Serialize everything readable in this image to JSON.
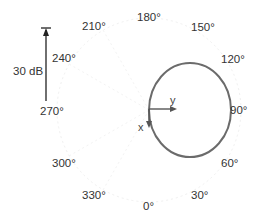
{
  "diagram": {
    "type": "polar-radiation-pattern",
    "colors": {
      "pattern": "#6b6b6b",
      "arrows": "#555555",
      "scale_bar": "#222222",
      "grid": "#eeeeee",
      "text": "#333333"
    },
    "angle_labels": [
      {
        "text": "180°",
        "angle": 180
      },
      {
        "text": "150°",
        "angle": 150
      },
      {
        "text": "120°",
        "angle": 120
      },
      {
        "text": "90°",
        "angle": 90
      },
      {
        "text": "60°",
        "angle": 60
      },
      {
        "text": "30°",
        "angle": 30
      },
      {
        "text": "0°",
        "angle": 0
      },
      {
        "text": "330°",
        "angle": 330
      },
      {
        "text": "300°",
        "angle": 300
      },
      {
        "text": "270°",
        "angle": 270
      },
      {
        "text": "240°",
        "angle": 240
      },
      {
        "text": "210°",
        "angle": 210
      }
    ],
    "scale_bar": {
      "label": "30 dB"
    },
    "axes": {
      "x_label": "x",
      "y_label": "y"
    }
  }
}
